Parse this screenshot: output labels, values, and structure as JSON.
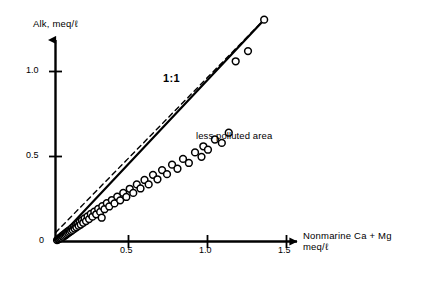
{
  "figure": {
    "background": "#ffffff",
    "ink": "#000000"
  },
  "axes": {
    "y_label": "Alk, meq/ℓ",
    "x_label_line1": "Nonmarine Ca + Mg",
    "x_label_line2": "meq/ℓ",
    "x_ticks": [
      "0.5",
      "1.0",
      "1.5"
    ],
    "y_ticks": [
      "1.0",
      "0.5",
      "0"
    ],
    "y_tick_1_0": "1.0",
    "y_tick_0_5": "0.5",
    "y_tick_0": "0",
    "x_tick_0_5": "0.5",
    "x_tick_1_0": "1.0",
    "x_tick_1_5": "1.5"
  },
  "annotations": {
    "ratio_line": "1:1",
    "region": "less polluted area"
  },
  "chart_data": {
    "type": "scatter",
    "title": "",
    "xlabel": "Nonmarine Ca + Mg meq/ℓ",
    "ylabel": "Alk, meq/ℓ",
    "xlim": [
      0,
      1.55
    ],
    "ylim": [
      0,
      1.42
    ],
    "grid": false,
    "legend": null,
    "marker": {
      "style": "open-circle",
      "facecolor": "#ffffff",
      "edgecolor": "#000000",
      "radius_data_units": 0.022
    },
    "series": [
      {
        "name": "samples",
        "type": "scatter",
        "points": [
          [
            0.01,
            0.008
          ],
          [
            0.016,
            0.012
          ],
          [
            0.021,
            0.015
          ],
          [
            0.026,
            0.02
          ],
          [
            0.03,
            0.018
          ],
          [
            0.034,
            0.026
          ],
          [
            0.038,
            0.022
          ],
          [
            0.042,
            0.03
          ],
          [
            0.046,
            0.035
          ],
          [
            0.05,
            0.028
          ],
          [
            0.054,
            0.04
          ],
          [
            0.058,
            0.033
          ],
          [
            0.062,
            0.046
          ],
          [
            0.066,
            0.038
          ],
          [
            0.07,
            0.052
          ],
          [
            0.074,
            0.044
          ],
          [
            0.078,
            0.058
          ],
          [
            0.083,
            0.05
          ],
          [
            0.087,
            0.064
          ],
          [
            0.092,
            0.056
          ],
          [
            0.097,
            0.07
          ],
          [
            0.102,
            0.062
          ],
          [
            0.107,
            0.078
          ],
          [
            0.112,
            0.068
          ],
          [
            0.118,
            0.086
          ],
          [
            0.124,
            0.076
          ],
          [
            0.13,
            0.094
          ],
          [
            0.136,
            0.084
          ],
          [
            0.143,
            0.104
          ],
          [
            0.15,
            0.092
          ],
          [
            0.157,
            0.114
          ],
          [
            0.164,
            0.1
          ],
          [
            0.172,
            0.124
          ],
          [
            0.18,
            0.11
          ],
          [
            0.189,
            0.136
          ],
          [
            0.198,
            0.12
          ],
          [
            0.208,
            0.148
          ],
          [
            0.218,
            0.132
          ],
          [
            0.229,
            0.162
          ],
          [
            0.24,
            0.146
          ],
          [
            0.252,
            0.176
          ],
          [
            0.264,
            0.16
          ],
          [
            0.277,
            0.192
          ],
          [
            0.29,
            0.174
          ],
          [
            0.304,
            0.208
          ],
          [
            0.318,
            0.19
          ],
          [
            0.333,
            0.226
          ],
          [
            0.349,
            0.206
          ],
          [
            0.366,
            0.244
          ],
          [
            0.383,
            0.224
          ],
          [
            0.3,
            0.14
          ],
          [
            0.401,
            0.264
          ],
          [
            0.42,
            0.242
          ],
          [
            0.44,
            0.286
          ],
          [
            0.46,
            0.262
          ],
          [
            0.482,
            0.31
          ],
          [
            0.505,
            0.286
          ],
          [
            0.528,
            0.336
          ],
          [
            0.552,
            0.312
          ],
          [
            0.578,
            0.362
          ],
          [
            0.605,
            0.336
          ],
          [
            0.633,
            0.392
          ],
          [
            0.662,
            0.366
          ],
          [
            0.692,
            0.42
          ],
          [
            0.724,
            0.396
          ],
          [
            0.757,
            0.452
          ],
          [
            0.792,
            0.428
          ],
          [
            0.828,
            0.486
          ],
          [
            0.866,
            0.462
          ],
          [
            0.906,
            0.524
          ],
          [
            0.948,
            0.498
          ],
          [
            0.96,
            0.56
          ],
          [
            0.99,
            0.54
          ],
          [
            1.035,
            0.6
          ],
          [
            1.08,
            0.58
          ],
          [
            1.125,
            0.64
          ],
          [
            1.17,
            1.06
          ],
          [
            1.25,
            1.12
          ],
          [
            1.355,
            1.305
          ]
        ]
      }
    ],
    "lines": [
      {
        "name": "regression-line",
        "style": "solid",
        "linewidth": 2.2,
        "color": "#000000",
        "from": [
          0.0,
          0.0
        ],
        "to": [
          1.355,
          1.305
        ],
        "slope": 0.963,
        "intercept": 0.0
      },
      {
        "name": "one-to-one-line",
        "style": "dashed",
        "linewidth": 1.4,
        "color": "#000000",
        "dash_pattern": [
          5,
          4
        ],
        "from": [
          0.0,
          0.052
        ],
        "to": [
          1.355,
          1.305
        ],
        "slope": 0.925,
        "intercept": 0.052
      }
    ]
  }
}
